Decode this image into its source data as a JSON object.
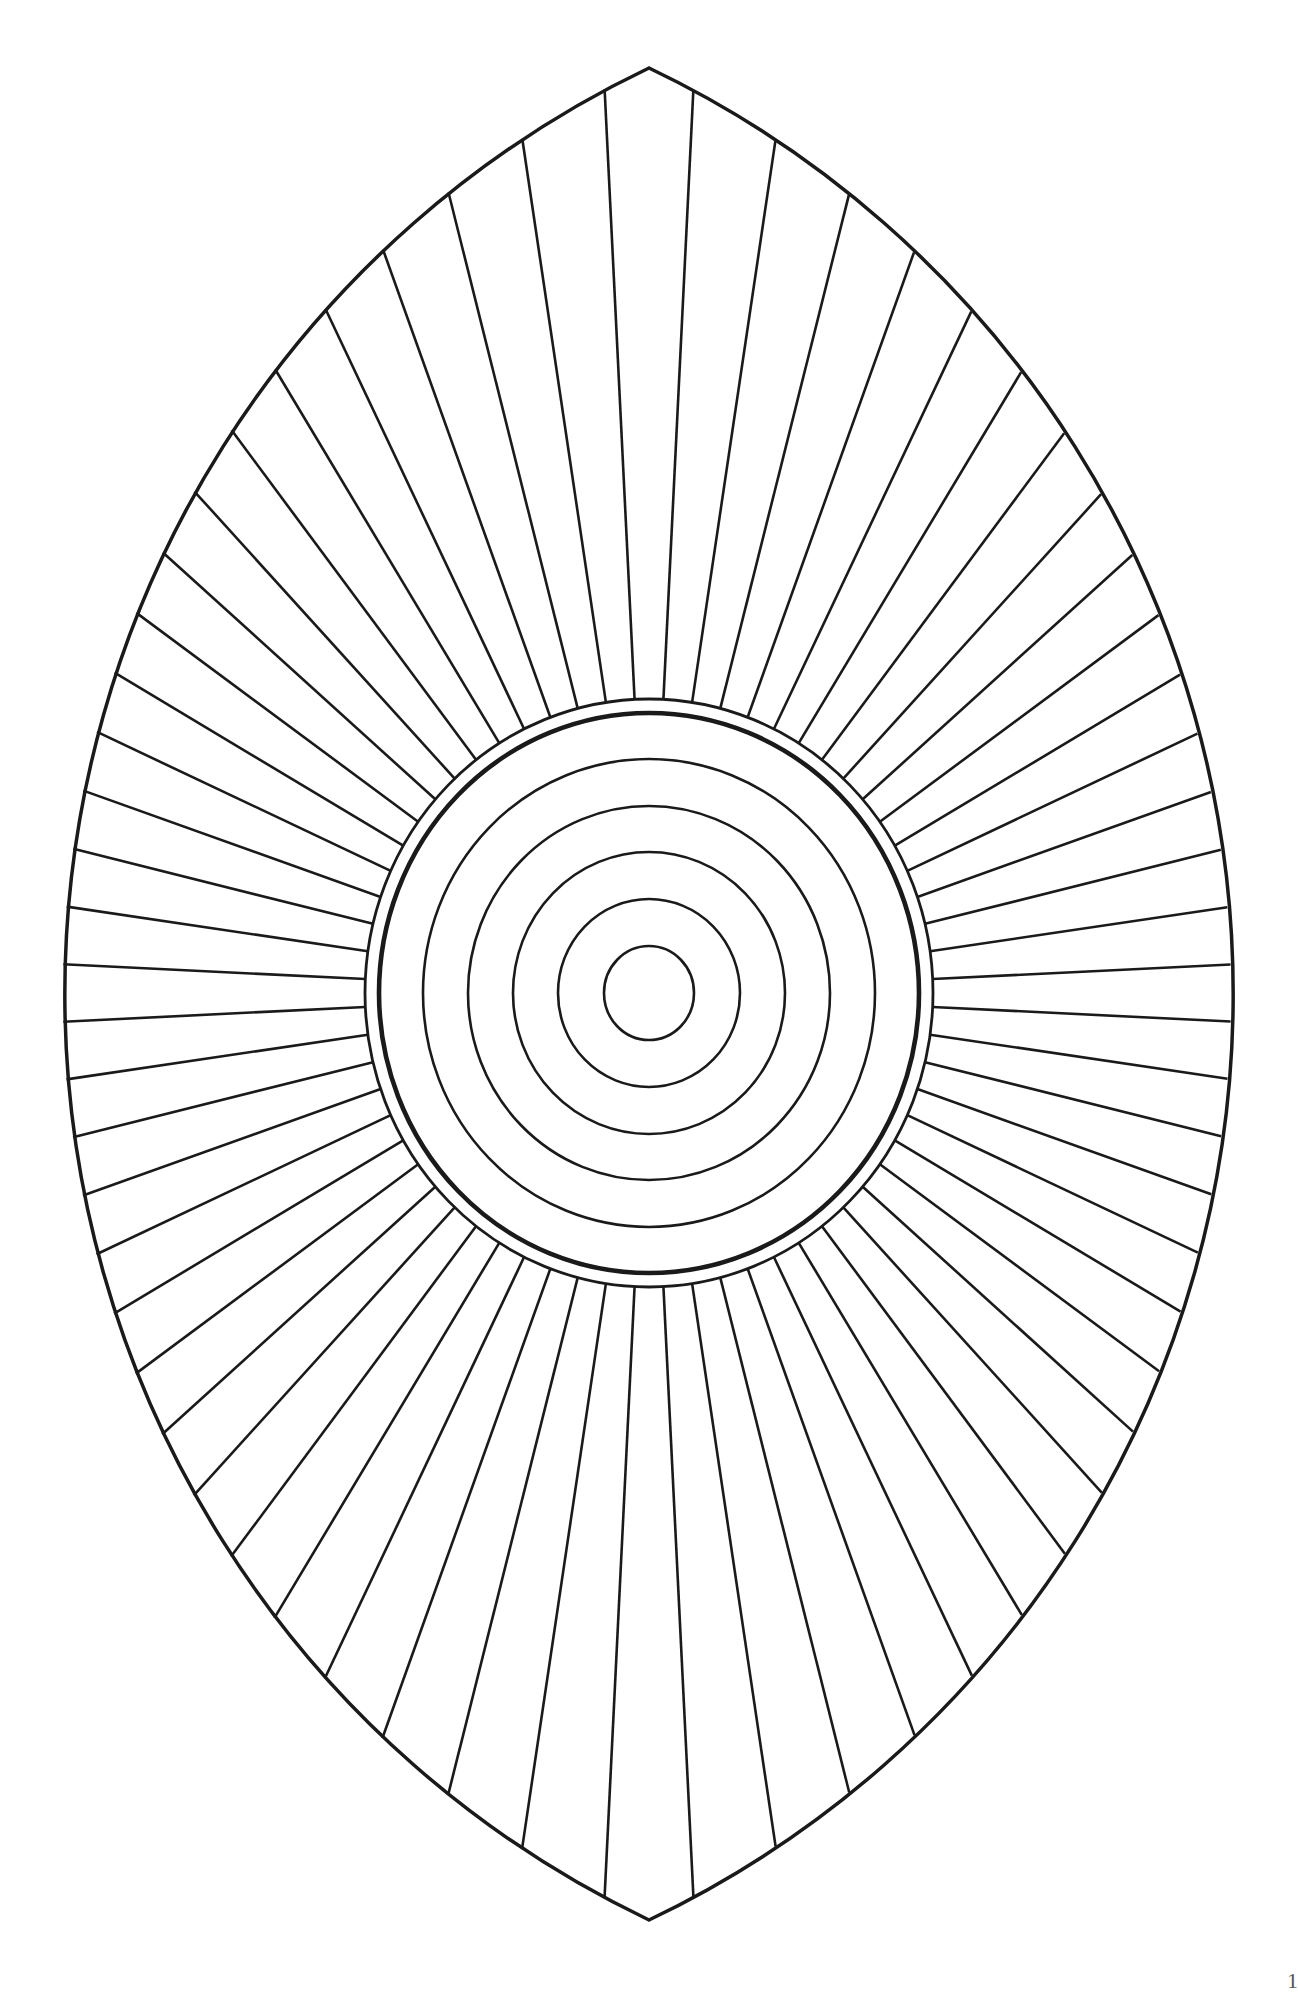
{
  "page": {
    "width": 1295,
    "height": 1993,
    "background": "#ffffff",
    "page_number": "1"
  },
  "drawing": {
    "title": "Vesica mandala coloring page",
    "stroke_color": "#1a1a1a",
    "center": {
      "x": 649,
      "y": 993
    },
    "vesica": {
      "top_tip": {
        "x": 649,
        "y": 68
      },
      "bottom_tip": {
        "x": 649,
        "y": 1920
      },
      "left_extreme_x": 63,
      "right_extreme_x": 1231,
      "arc_radius": 1026,
      "stroke_width": 3.5
    },
    "rings": [
      {
        "rx": 45,
        "ry": 47,
        "stroke_width": 2.6
      },
      {
        "rx": 91,
        "ry": 94,
        "stroke_width": 2.6
      },
      {
        "rx": 136,
        "ry": 141,
        "stroke_width": 2.6
      },
      {
        "rx": 181,
        "ry": 187,
        "stroke_width": 2.6
      },
      {
        "rx": 226,
        "ry": 234,
        "stroke_width": 2.6
      },
      {
        "rx": 270,
        "ry": 280,
        "stroke_width": 4.6
      },
      {
        "rx": 284,
        "ry": 294,
        "stroke_width": 2.8
      }
    ],
    "rays": {
      "count": 64,
      "angle_offset_deg": 2.8125,
      "stroke_width": 2.6,
      "start_ring_index": 6
    }
  }
}
